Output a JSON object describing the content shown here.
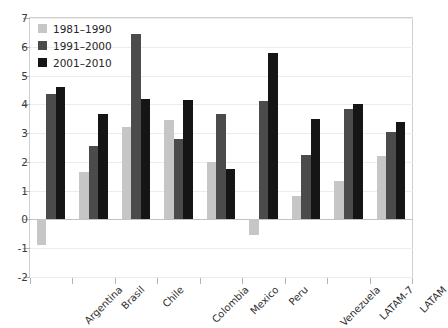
{
  "chart_data": {
    "type": "bar",
    "title": "",
    "subtitle": "",
    "xlabel": "",
    "ylabel": "",
    "ylim": [
      -2,
      7
    ],
    "ytick_values": [
      7,
      6,
      5,
      4,
      3,
      2,
      1,
      0,
      -1,
      -2
    ],
    "ytick_labels": [
      "7",
      "6",
      "5",
      "4",
      "3",
      "2",
      "1",
      "0",
      "-1",
      "-2"
    ],
    "grid": true,
    "legend_position": "top-left",
    "categories": [
      "Argentina",
      "Brasil",
      "Chile",
      "Colombia",
      "Mexico",
      "Peru",
      "Venezuela",
      "LATAM-7",
      "LATAM"
    ],
    "series": [
      {
        "name": "1981–1990",
        "color": "#c6c6c6",
        "values": [
          -0.9,
          1.65,
          3.2,
          3.45,
          2.0,
          -0.55,
          0.8,
          1.35,
          2.2
        ]
      },
      {
        "name": "1991–2000",
        "color": "#4b4b4b",
        "values": [
          4.35,
          2.55,
          6.45,
          2.8,
          3.65,
          4.1,
          2.25,
          3.85,
          3.05
        ]
      },
      {
        "name": "2001–2010",
        "color": "#151515",
        "values": [
          4.6,
          3.67,
          4.2,
          4.15,
          1.75,
          5.8,
          3.5,
          4.0,
          3.4
        ]
      }
    ]
  },
  "legend": {
    "items": [
      {
        "label": "1981–1990"
      },
      {
        "label": "1991–2000"
      },
      {
        "label": "2001–2010"
      }
    ]
  },
  "colors": {
    "series_1981_1990": "#c6c6c6",
    "series_1991_2000": "#4b4b4b",
    "series_2001_2010": "#151515",
    "frame": "#d0d0d0",
    "gridline": "#ececec",
    "zero_line": "#c2c2c2",
    "text": "#2e2e2e"
  }
}
